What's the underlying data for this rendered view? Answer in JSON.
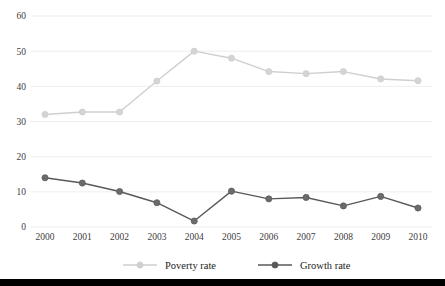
{
  "chart_data": {
    "type": "line",
    "title": "",
    "subtitle": "",
    "xlabel": "",
    "ylabel": "",
    "categories": [
      "2000",
      "2001",
      "2002",
      "2003",
      "2004",
      "2005",
      "2006",
      "2007",
      "2008",
      "2009",
      "2010"
    ],
    "series": [
      {
        "name": "Poverty rate",
        "color": "#cfcfcf",
        "marker_fill": "#d4d4d4",
        "values": [
          32.0,
          32.7,
          32.7,
          41.5,
          50.0,
          48.0,
          44.2,
          43.6,
          44.2,
          42.1,
          41.6
        ]
      },
      {
        "name": "Growth rate",
        "color": "#595959",
        "marker_fill": "#6b6b6b",
        "values": [
          14.0,
          12.5,
          10.1,
          6.9,
          1.7,
          10.2,
          8.0,
          8.4,
          6.0,
          8.7,
          5.4
        ]
      }
    ],
    "ylim": [
      0,
      60
    ],
    "yticks": [
      0,
      10,
      20,
      30,
      40,
      50,
      60
    ],
    "ytick_labels": [
      "0",
      "10",
      "20",
      "30",
      "40",
      "50",
      "60"
    ],
    "grid": true,
    "grid_color": "#e8e8e8",
    "legend_position": "bottom",
    "background": "#ffffff"
  },
  "legend": {
    "items": [
      {
        "label": "Poverty rate",
        "color": "#cfcfcf"
      },
      {
        "label": "Growth rate",
        "color": "#595959"
      }
    ]
  },
  "footer": {
    "rule_color": "#000000"
  }
}
